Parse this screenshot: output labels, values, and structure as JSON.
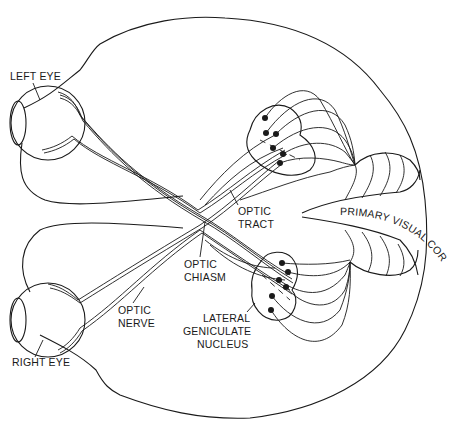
{
  "diagram": {
    "colors": {
      "line": "#1a1a1a",
      "background": "#ffffff"
    },
    "labels": {
      "left_eye": "LEFT EYE",
      "right_eye": "RIGHT EYE",
      "optic_nerve_1": "OPTIC",
      "optic_nerve_2": "NERVE",
      "optic_chiasm_1": "OPTIC",
      "optic_chiasm_2": "CHIASM",
      "optic_tract_1": "OPTIC",
      "optic_tract_2": "TRACT",
      "lgn_1": "LATERAL",
      "lgn_2": "GENICULATE",
      "lgn_3": "NUCLEUS",
      "primary_visual_cortex": "PRIMARY VISUAL CORTEX"
    },
    "structures": [
      "brain-outline",
      "left-eye",
      "right-eye",
      "optic-nerves",
      "optic-chiasm",
      "optic-tracts",
      "lateral-geniculate-nucleus-left",
      "lateral-geniculate-nucleus-right",
      "optic-radiations",
      "primary-visual-cortex"
    ]
  }
}
